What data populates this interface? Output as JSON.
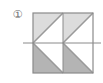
{
  "figure": {
    "marker_label": "①",
    "marker_number": "1",
    "title": "",
    "type": "symmetry-tiling-figure",
    "canvas": {
      "width": 103,
      "height": 83,
      "background": "#ffffff"
    },
    "square": {
      "x": 33,
      "y": 13,
      "width": 60,
      "height": 60,
      "rows": 2,
      "cols": 2,
      "border_color": "#8a8a8a",
      "border_width": 1
    },
    "colors": {
      "light_fill": "#dcdcdc",
      "dark_fill": "#b4b4b4",
      "white_fill": "#ffffff",
      "outline": "#8a8a8a",
      "diagonal": "#9a9a9a",
      "mirror_line": "#8a8a8a",
      "marker_text": "#6e6e6e"
    },
    "cells": [
      {
        "name": "top-left-cell",
        "row": 0,
        "col": 0,
        "diagonal": "bottom-left-to-top-right",
        "shaded_triangle": "upper-left",
        "shaded_fill": "#dcdcdc",
        "unshaded_fill": "#ffffff"
      },
      {
        "name": "top-right-cell",
        "row": 0,
        "col": 1,
        "diagonal": "bottom-left-to-top-right",
        "shaded_triangle": "upper-left",
        "shaded_fill": "#dcdcdc",
        "unshaded_fill": "#ffffff"
      },
      {
        "name": "bottom-left-cell",
        "row": 1,
        "col": 0,
        "diagonal": "top-left-to-bottom-right",
        "shaded_triangle": "lower-left",
        "shaded_fill": "#b4b4b4",
        "unshaded_fill": "#ffffff"
      },
      {
        "name": "bottom-right-cell",
        "row": 1,
        "col": 1,
        "diagonal": "top-left-to-bottom-right",
        "shaded_triangle": "lower-left",
        "shaded_fill": "#b4b4b4",
        "unshaded_fill": "#ffffff"
      }
    ],
    "mirror_line": {
      "orientation": "horizontal",
      "y": 43,
      "x_start": 23,
      "x_end": 101,
      "extends_beyond_square": true,
      "color": "#8a8a8a"
    }
  }
}
